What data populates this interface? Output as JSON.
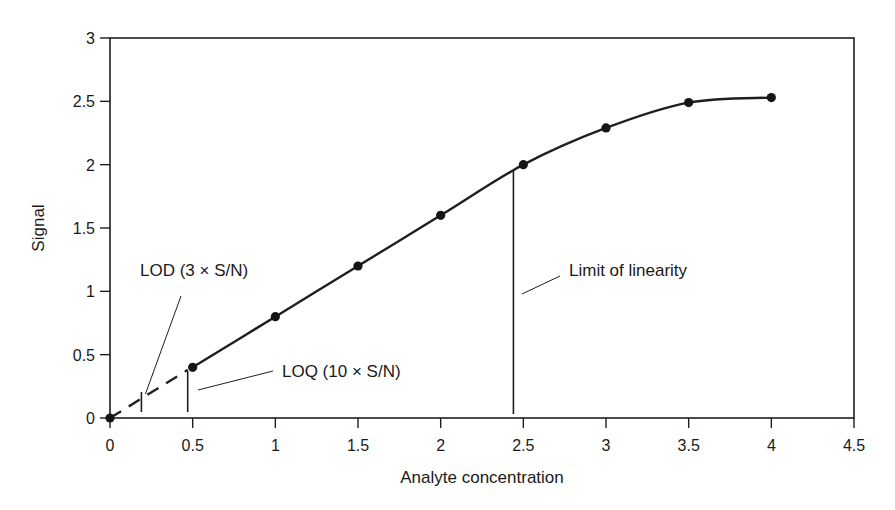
{
  "chart_data": {
    "type": "line",
    "title": "",
    "xlabel": "Analyte concentration",
    "ylabel": "Signal",
    "xlim": [
      0,
      4.5
    ],
    "ylim": [
      0,
      3
    ],
    "x_ticks": [
      0,
      0.5,
      1,
      1.5,
      2,
      2.5,
      3,
      3.5,
      4,
      4.5
    ],
    "x_tick_labels": [
      "0",
      "0.5",
      "1",
      "1.5",
      "2",
      "2.5",
      "3",
      "3.5",
      "4",
      "4.5"
    ],
    "y_ticks": [
      0,
      0.5,
      1,
      1.5,
      2,
      2.5,
      3
    ],
    "y_tick_labels": [
      "0",
      "0.5",
      "1",
      "1.5",
      "2",
      "2.5",
      "3"
    ],
    "grid": false,
    "legend": null,
    "series": [
      {
        "name": "Calibration curve",
        "style": "solid with markers",
        "x": [
          0,
          0.5,
          1,
          1.5,
          2,
          2.5,
          3,
          3.5,
          4
        ],
        "y": [
          0,
          0.4,
          0.8,
          1.2,
          1.6,
          2.0,
          2.29,
          2.49,
          2.53
        ]
      },
      {
        "name": "Extrapolation below LOQ",
        "style": "dashed",
        "x": [
          0,
          0.47
        ],
        "y": [
          0,
          0.38
        ]
      }
    ],
    "annotations": [
      {
        "label": "LOD (3 × S/N)",
        "x": 0.19,
        "type": "tick-mark"
      },
      {
        "label": "LOQ (10 × S/N)",
        "x": 0.47,
        "type": "vertical-line"
      },
      {
        "label": "Limit of linearity",
        "x": 2.44,
        "type": "vertical-line"
      }
    ]
  }
}
